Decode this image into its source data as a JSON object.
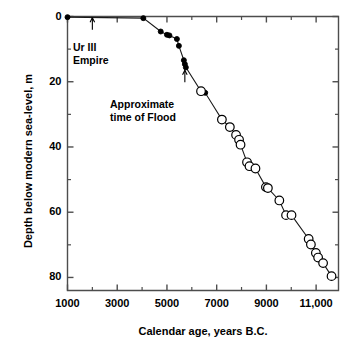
{
  "chart_data": {
    "type": "line",
    "title": "",
    "subtitle": "",
    "xlabel": "Calendar age, years B.C.",
    "ylabel": "Depth below modern sea-level, m",
    "xlim": [
      1000,
      11900
    ],
    "ylim": [
      0,
      84
    ],
    "y_inverted": true,
    "grid": false,
    "legend_position": "none",
    "x_major_ticks": [
      1000,
      3000,
      5000,
      7000,
      9000,
      11000
    ],
    "x_major_tick_labels": [
      "1000",
      "3000",
      "5000",
      "7000",
      "9000",
      "11,000"
    ],
    "x_minor_ticks": [
      2000,
      4000,
      6000,
      8000,
      10000
    ],
    "y_major_ticks": [
      0,
      20,
      40,
      60,
      80
    ],
    "y_major_tick_labels": [
      "0",
      "20",
      "40",
      "60",
      "80"
    ],
    "y_minor_ticks": [
      10,
      30,
      50,
      70
    ],
    "series": [
      {
        "name": "Archaeological / historical sea-level (filled symbols)",
        "marker": "filled-circle",
        "points": [
          {
            "x": 1000,
            "y": 0.2
          },
          {
            "x": 4050,
            "y": 0.5
          },
          {
            "x": 4750,
            "y": 4.6
          },
          {
            "x": 5000,
            "y": 5.6
          },
          {
            "x": 5100,
            "y": 5.8
          },
          {
            "x": 5400,
            "y": 6.9
          },
          {
            "x": 5480,
            "y": 9.0
          },
          {
            "x": 5680,
            "y": 13.4
          },
          {
            "x": 5720,
            "y": 14.6
          },
          {
            "x": 5760,
            "y": 15.6
          },
          {
            "x": 6540,
            "y": 23.4
          }
        ]
      },
      {
        "name": "Radiocarbon-dated samples (open symbols)",
        "marker": "open-circle",
        "points": [
          {
            "x": 6370,
            "y": 22.9
          },
          {
            "x": 7210,
            "y": 31.6
          },
          {
            "x": 7530,
            "y": 33.9
          },
          {
            "x": 7780,
            "y": 36.3
          },
          {
            "x": 7900,
            "y": 37.8
          },
          {
            "x": 7960,
            "y": 39.3
          },
          {
            "x": 8220,
            "y": 44.7
          },
          {
            "x": 8320,
            "y": 45.9
          },
          {
            "x": 8560,
            "y": 46.6
          },
          {
            "x": 8980,
            "y": 52.3
          },
          {
            "x": 9060,
            "y": 52.6
          },
          {
            "x": 9520,
            "y": 56.4
          },
          {
            "x": 9790,
            "y": 60.9
          },
          {
            "x": 10010,
            "y": 60.9
          },
          {
            "x": 10700,
            "y": 68.2
          },
          {
            "x": 10790,
            "y": 69.9
          },
          {
            "x": 10990,
            "y": 72.5
          },
          {
            "x": 11080,
            "y": 73.9
          },
          {
            "x": 11280,
            "y": 75.6
          },
          {
            "x": 11620,
            "y": 79.6
          }
        ]
      }
    ],
    "annotations": [
      {
        "id": "ur-iii-empire",
        "text_lines": [
          "Ur III",
          "Empire"
        ],
        "arrow_points_to_x": 2000,
        "arrow_points_to_y": 0.4,
        "arrow_direction": "up"
      },
      {
        "id": "approximate-time-of-flood",
        "text_lines": [
          "Approximate",
          "time of Flood"
        ],
        "arrow_points_to_x": 5720,
        "arrow_points_to_y": 16.5,
        "arrow_direction": "up"
      }
    ],
    "colors": {
      "line": "#1a1a1a",
      "marker_fill": "#000000",
      "marker_open_fill": "#ffffff",
      "marker_edge": "#000000",
      "axis": "#4d4d4d",
      "text": "#000000",
      "background": "#ffffff"
    }
  }
}
